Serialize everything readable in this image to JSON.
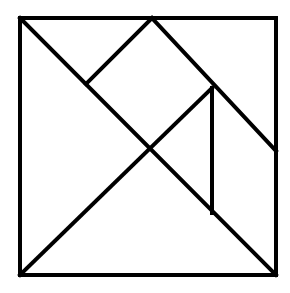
{
  "diagram": {
    "type": "tangram",
    "stroke_color": "#000000",
    "background": "#ffffff",
    "outer_square": {
      "x1": 20,
      "y1": 18,
      "x2": 276,
      "y2": 275
    },
    "points": {
      "top_left": [
        20,
        18
      ],
      "top_mid": [
        152,
        18
      ],
      "top_right": [
        276,
        18
      ],
      "left_mid_upper": [
        86,
        84
      ],
      "center": [
        148,
        149
      ],
      "right_upper": [
        212,
        88
      ],
      "right_edge_mid": [
        276,
        151
      ],
      "inner_bottom": [
        212,
        213
      ],
      "bottom_left": [
        20,
        275
      ],
      "bottom_right": [
        276,
        275
      ]
    },
    "pieces": [
      {
        "name": "large-triangle-left",
        "points": "20,18 148,149 20,275"
      },
      {
        "name": "large-triangle-bottom",
        "points": "20,275 148,149 276,275"
      },
      {
        "name": "square-piece",
        "points": "152,18 212,88 148,149 86,84"
      },
      {
        "name": "small-triangle-top",
        "points": "20,18 152,18 86,84"
      },
      {
        "name": "parallelogram-right",
        "points": "152,18 276,18 276,151 212,88"
      },
      {
        "name": "small-triangle-mid",
        "points": "212,88 148,149 212,213"
      },
      {
        "name": "medium-piece-right",
        "points": "212,88 276,151 276,275 212,213"
      }
    ]
  }
}
